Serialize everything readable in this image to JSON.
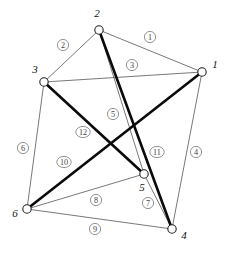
{
  "figure": {
    "kind": "node-link-diagram",
    "width": 226,
    "height": 255,
    "background": "#ffffff",
    "thin_edge_color": "#555555",
    "thick_edge_color": "#0a0a0a",
    "node_fill": "#ffffff",
    "node_stroke": "#222222"
  },
  "graph_data": {
    "type": "graph",
    "directed": false,
    "node_count": 6,
    "edge_count": 12,
    "nodes": [
      {
        "id": "1",
        "label": "1",
        "x": 202,
        "y": 72,
        "label_x": 215,
        "label_y": 65,
        "r": 4.2
      },
      {
        "id": "2",
        "label": "2",
        "x": 99,
        "y": 30,
        "label_x": 97,
        "label_y": 14,
        "r": 4.2
      },
      {
        "id": "3",
        "label": "3",
        "x": 44,
        "y": 82,
        "label_x": 35,
        "label_y": 70,
        "r": 4.2
      },
      {
        "id": "4",
        "label": "4",
        "x": 172,
        "y": 229,
        "label_x": 184,
        "label_y": 236,
        "r": 4.2
      },
      {
        "id": "5",
        "label": "5",
        "x": 144,
        "y": 174,
        "label_x": 142,
        "label_y": 188,
        "r": 4.2
      },
      {
        "id": "6",
        "label": "6",
        "x": 27,
        "y": 209,
        "label_x": 15,
        "label_y": 214,
        "r": 4.2
      }
    ],
    "edges": [
      {
        "id": "e1",
        "label": "1",
        "source": "2",
        "target": "1",
        "weight": "thin",
        "label_x": 150,
        "label_y": 37
      },
      {
        "id": "e2",
        "label": "2",
        "source": "2",
        "target": "3",
        "weight": "thin",
        "label_x": 63,
        "label_y": 45
      },
      {
        "id": "e3",
        "label": "3",
        "source": "3",
        "target": "1",
        "weight": "thin",
        "label_x": 132,
        "label_y": 65
      },
      {
        "id": "e4",
        "label": "4",
        "source": "1",
        "target": "4",
        "weight": "thin",
        "label_x": 196,
        "label_y": 152
      },
      {
        "id": "e5",
        "label": "5",
        "source": "2",
        "target": "5",
        "weight": "thin",
        "label_x": 113,
        "label_y": 114
      },
      {
        "id": "e6",
        "label": "6",
        "source": "3",
        "target": "6",
        "weight": "thin",
        "label_x": 23,
        "label_y": 148
      },
      {
        "id": "e7",
        "label": "7",
        "source": "5",
        "target": "4",
        "weight": "thin",
        "label_x": 148,
        "label_y": 203
      },
      {
        "id": "e8",
        "label": "8",
        "source": "6",
        "target": "5",
        "weight": "thin",
        "label_x": 96,
        "label_y": 200
      },
      {
        "id": "e9",
        "label": "9",
        "source": "6",
        "target": "4",
        "weight": "thin",
        "label_x": 95,
        "label_y": 229
      },
      {
        "id": "e10",
        "label": "10",
        "source": "6",
        "target": "1",
        "weight": "thick",
        "label_x": 64,
        "label_y": 162
      },
      {
        "id": "e11",
        "label": "11",
        "source": "2",
        "target": "4",
        "weight": "thick",
        "label_x": 157,
        "label_y": 152
      },
      {
        "id": "e12",
        "label": "12",
        "source": "3",
        "target": "5",
        "weight": "thick",
        "label_x": 83,
        "label_y": 132
      }
    ]
  }
}
